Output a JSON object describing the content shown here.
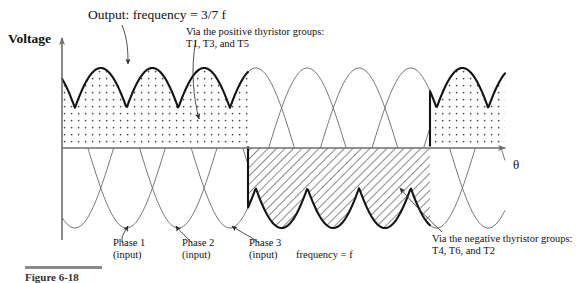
{
  "figure": {
    "title_label": "Output: frequency = 3/7 f",
    "y_axis_label": "Voltage",
    "x_axis_label": "θ",
    "positive_note": "Via the positive thyristor groups: T1, T3, and T5",
    "negative_note": "Via the negative thyristor groups: T4, T6, and T2",
    "input_frequency_label": "frequency = f",
    "phase_labels": [
      {
        "name": "Phase 1",
        "sub": "(input)"
      },
      {
        "name": "Phase 2",
        "sub": "(input)"
      },
      {
        "name": "Phase 3",
        "sub": "(input)"
      }
    ],
    "caption": "Figure  6-18"
  },
  "colors": {
    "axis": "#6e6e6e",
    "input_wave": "#707070",
    "output_wave": "#141414",
    "dot_fill": "#4a4a4a",
    "hatch_fill": "#2a2a2a",
    "leader": "#3a3a3a",
    "text": "#111111",
    "caption_rule": "#8a8a8a"
  },
  "chart_data": {
    "type": "line",
    "title": "Output: frequency = 3/7 f",
    "xlabel": "θ",
    "ylabel": "Voltage",
    "grid": false,
    "legend": "annotations",
    "axis_origin_px": {
      "x": 62,
      "y": 148
    },
    "amplitude_px": 80,
    "period_px": 155,
    "phase_offset_px": 51.67,
    "x_range_px": [
      62,
      505
    ],
    "series": [
      {
        "name": "Phase 1 (input)",
        "phase_deg": 0,
        "amplitude": 1,
        "frequency": "f",
        "style": "thin"
      },
      {
        "name": "Phase 2 (input)",
        "phase_deg": -120,
        "amplitude": 1,
        "frequency": "f",
        "style": "thin"
      },
      {
        "name": "Phase 3 (input)",
        "phase_deg": -240,
        "amplitude": 1,
        "frequency": "f",
        "style": "thin"
      }
    ],
    "output": {
      "name": "Output",
      "frequency": "3/7 f",
      "style": "thick",
      "segments": [
        {
          "polarity": "positive",
          "fill": "dotted",
          "source": "T1, T3, T5",
          "x_start_px": 62,
          "x_end_px": 248,
          "lobes": 3
        },
        {
          "polarity": "negative",
          "fill": "hatched",
          "source": "T4, T6, T2",
          "x_start_px": 248,
          "x_end_px": 430,
          "lobes": 3
        },
        {
          "polarity": "positive",
          "fill": "dotted",
          "source": "T1, T3, T5",
          "x_start_px": 430,
          "x_end_px": 505,
          "lobes": 1
        }
      ]
    },
    "annotations": [
      {
        "text": "Output: frequency = 3/7 f",
        "target_px": [
          128,
          69
        ]
      },
      {
        "text": "Via the positive thyristor groups: T1, T3, and T5",
        "target_px": [
          199,
          124
        ]
      },
      {
        "text": "Via the negative thyristor groups: T4, T6, and T2",
        "target_px": [
          398,
          184
        ]
      },
      {
        "text": "Phase 1 (input)",
        "target_px": [
          128,
          228
        ]
      },
      {
        "text": "Phase 2 (input)",
        "target_px": [
          179,
          228
        ]
      },
      {
        "text": "Phase 3 (input)",
        "target_px": [
          231,
          228
        ]
      }
    ]
  }
}
